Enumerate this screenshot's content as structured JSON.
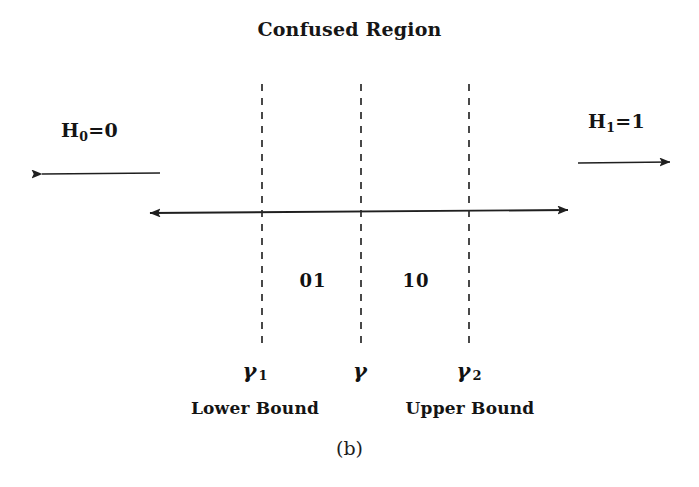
{
  "figure": {
    "title": "Confused Region",
    "caption": "(b)"
  },
  "hypotheses": {
    "null": {
      "symbol": "H",
      "subscript": "0",
      "equals": "=0",
      "text": "H0=0"
    },
    "alt": {
      "symbol": "H",
      "subscript": "1",
      "equals": "=1",
      "text": "H1=1"
    }
  },
  "regions": [
    {
      "name": "lower-confused",
      "label": "01"
    },
    {
      "name": "upper-confused",
      "label": "10"
    }
  ],
  "thresholds": [
    {
      "name": "lower",
      "symbol": "γ",
      "subscript": "1",
      "caption": "Lower Bound"
    },
    {
      "name": "center",
      "symbol": "γ",
      "subscript": "",
      "caption": ""
    },
    {
      "name": "upper",
      "symbol": "γ",
      "subscript": "2",
      "caption": "Upper Bound"
    }
  ],
  "colors": {
    "ink": "#1a1a1a",
    "background": "#ffffff",
    "axis": "#1f1f1f",
    "dashed": "#2a2a2a"
  }
}
